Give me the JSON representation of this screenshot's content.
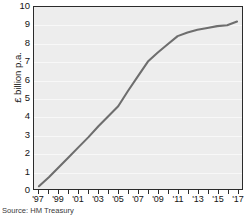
{
  "source_note": "Source: HM Treasury",
  "chart_data": {
    "type": "line",
    "title": "",
    "subtitle": "",
    "xlabel": "",
    "ylabel": "£ billion p.a.",
    "xlim": [
      1996.5,
      2017.5
    ],
    "ylim": [
      0,
      10
    ],
    "grid": true,
    "legend": "none",
    "y_ticks": [
      0,
      1,
      2,
      3,
      4,
      5,
      6,
      7,
      8,
      9,
      10
    ],
    "y_tick_labels": [
      "0",
      "1",
      "2",
      "3",
      "4",
      "5",
      "6",
      "7",
      "8",
      "9",
      "10"
    ],
    "x_ticks": [
      1997,
      1998,
      1999,
      2000,
      2001,
      2002,
      2003,
      2004,
      2005,
      2006,
      2007,
      2008,
      2009,
      2010,
      2011,
      2012,
      2013,
      2014,
      2015,
      2016,
      2017
    ],
    "x_tick_labels": [
      "'97",
      "",
      "'99",
      "",
      "'01",
      "",
      "'03",
      "",
      "'05",
      "",
      "'07",
      "",
      "'09",
      "",
      "'11",
      "",
      "'13",
      "",
      "'15",
      "",
      "'17"
    ],
    "series": [
      {
        "name": "£ billion p.a.",
        "color": "#6e6e6e",
        "x": [
          1997,
          1998,
          1999,
          2000,
          2001,
          2002,
          2003,
          2004,
          2005,
          2006,
          2007,
          2008,
          2009,
          2010,
          2011,
          2012,
          2013,
          2014,
          2015,
          2016,
          2017
        ],
        "values": [
          0.15,
          0.65,
          1.2,
          1.75,
          2.3,
          2.85,
          3.45,
          4.0,
          4.55,
          5.4,
          6.2,
          7.0,
          7.5,
          7.95,
          8.4,
          8.6,
          8.75,
          8.85,
          8.95,
          9.0,
          9.2
        ]
      }
    ]
  }
}
